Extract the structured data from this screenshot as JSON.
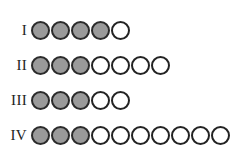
{
  "figure": {
    "name": "filled-circle-rows",
    "background_color": "#ffffff",
    "filled_color": "#9a9a9a",
    "empty_color": "#ffffff",
    "outline_color": "#232323"
  },
  "chart_data": {
    "type": "table",
    "title": "",
    "xlabel": "",
    "ylabel": "",
    "categories": [
      "I",
      "II",
      "III",
      "IV"
    ],
    "series": [
      {
        "name": "filled",
        "values": [
          4,
          3,
          3,
          3
        ]
      },
      {
        "name": "empty",
        "values": [
          1,
          4,
          2,
          7
        ]
      },
      {
        "name": "total",
        "values": [
          5,
          7,
          5,
          10
        ]
      }
    ]
  },
  "rows": [
    {
      "label": "I",
      "filled": 4,
      "empty": 1,
      "total": 5,
      "circles": [
        "filled",
        "filled",
        "filled",
        "filled",
        "empty"
      ]
    },
    {
      "label": "II",
      "filled": 3,
      "empty": 4,
      "total": 7,
      "circles": [
        "filled",
        "filled",
        "filled",
        "empty",
        "empty",
        "empty",
        "empty"
      ]
    },
    {
      "label": "III",
      "filled": 3,
      "empty": 2,
      "total": 5,
      "circles": [
        "filled",
        "filled",
        "filled",
        "empty",
        "empty"
      ]
    },
    {
      "label": "IV",
      "filled": 3,
      "empty": 7,
      "total": 10,
      "circles": [
        "filled",
        "filled",
        "filled",
        "empty",
        "empty",
        "empty",
        "empty",
        "empty",
        "empty",
        "empty"
      ]
    }
  ]
}
